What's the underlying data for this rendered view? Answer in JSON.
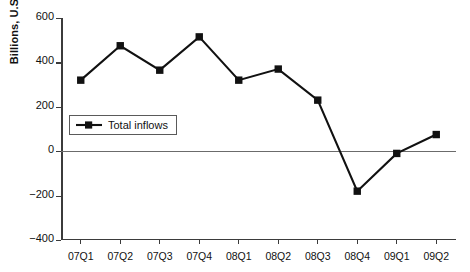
{
  "chart_data": {
    "type": "line",
    "title": "",
    "subtitle": "",
    "xlabel": "",
    "ylabel": "Billions, U.S. dollars",
    "categories": [
      "07Q1",
      "07Q2",
      "07Q3",
      "07Q4",
      "08Q1",
      "08Q2",
      "08Q3",
      "08Q4",
      "09Q1",
      "09Q2"
    ],
    "series": [
      {
        "name": "Total inflows",
        "values": [
          320,
          475,
          365,
          515,
          320,
          370,
          230,
          -180,
          -10,
          75
        ],
        "color": "#111111",
        "marker": "square"
      }
    ],
    "ylim": [
      -400,
      600
    ],
    "yticks": [
      600,
      400,
      200,
      0,
      -200,
      -400
    ],
    "ytick_labels": [
      "600",
      "400",
      "200",
      "0",
      "−200",
      "−400"
    ],
    "grid": false,
    "legend_position": "inside-left",
    "zero_line": true
  },
  "legend": {
    "entries": [
      {
        "label": "Total inflows",
        "symbol": "line-square-marker"
      }
    ]
  },
  "colors": {
    "series": "#111111",
    "axis": "#3b3b3b",
    "zero_line": "#6b6b6b",
    "background": "#ffffff",
    "text": "#111111"
  }
}
